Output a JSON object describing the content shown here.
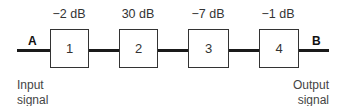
{
  "diagram": {
    "points": {
      "start": "A",
      "end": "B"
    },
    "blocks": [
      {
        "label": "1",
        "gain": "−2 dB"
      },
      {
        "label": "2",
        "gain": "30 dB"
      },
      {
        "label": "3",
        "gain": "−7 dB"
      },
      {
        "label": "4",
        "gain": "−1 dB"
      }
    ],
    "input_label": {
      "line1": "Input",
      "line2": "signal"
    },
    "output_label": {
      "line1": "Output",
      "line2": "signal"
    }
  }
}
